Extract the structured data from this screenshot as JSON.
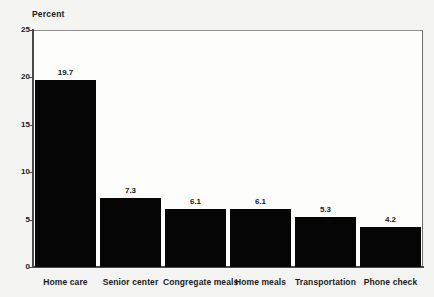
{
  "chart_data": {
    "type": "bar",
    "title": "",
    "subtitle": "",
    "xlabel": "",
    "ylabel": "Percent",
    "ylim": [
      0,
      25
    ],
    "yticks": [
      0,
      5,
      10,
      15,
      20,
      25
    ],
    "ytick_labels": [
      "0",
      "5",
      "10",
      "15",
      "20",
      "25"
    ],
    "grid": false,
    "legend": null,
    "bar_color": "#050505",
    "plot_background": "#fdfdfc",
    "page_background": "#f4f4f2",
    "categories": [
      "Home care",
      "Senior center",
      "Congregate meals",
      "Home meals",
      "Transportation",
      "Phone check"
    ],
    "values": [
      19.7,
      7.3,
      6.1,
      6.1,
      5.3,
      4.2
    ],
    "value_labels": [
      "19.7",
      "7.3",
      "6.1",
      "6.1",
      "5.3",
      "4.2"
    ]
  },
  "axis": {
    "y_title": "Percent"
  }
}
